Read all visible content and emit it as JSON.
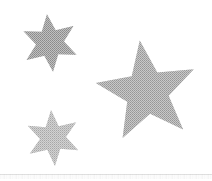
{
  "canvas": {
    "width": 212,
    "height": 181,
    "background_color": "#ffffff",
    "title": "Three gray stars on white background"
  },
  "shapes": [
    {
      "id": "star-top-left",
      "name": "six-pointed-star-top-left",
      "type": "star",
      "points": 6,
      "fill_color": "#9a9a9a",
      "fill_style": "dithered-halftone",
      "center_x": 50,
      "center_y": 43,
      "outer_radius": 29,
      "inner_radius": 14,
      "rotation_deg": -6,
      "size_label": "small"
    },
    {
      "id": "star-bottom-left",
      "name": "six-pointed-star-bottom-left",
      "type": "star",
      "points": 6,
      "fill_color": "#b7b7b7",
      "fill_style": "dithered-halftone",
      "center_x": 53,
      "center_y": 138,
      "outer_radius": 28,
      "inner_radius": 13,
      "rotation_deg": -4,
      "size_label": "small"
    },
    {
      "id": "star-right-large",
      "name": "five-pointed-star-right",
      "type": "star",
      "points": 5,
      "fill_color": "#a6a6a6",
      "fill_style": "dithered-halftone",
      "center_x": 147,
      "center_y": 92,
      "outer_radius": 52,
      "inner_radius": 22,
      "rotation_deg": -8,
      "size_label": "large"
    }
  ],
  "artifact": {
    "label": "bottom-edge-noise-strip",
    "color": "#a0a0a0",
    "visible": true
  }
}
